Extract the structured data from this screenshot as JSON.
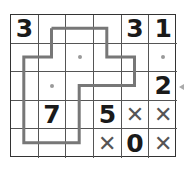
{
  "puzzle": {
    "rows": 5,
    "cols": 6,
    "cells": [
      [
        "3",
        "",
        "",
        "",
        "3",
        "1"
      ],
      [
        "",
        "",
        "",
        "",
        "",
        ""
      ],
      [
        "",
        "",
        "",
        "",
        "",
        "2"
      ],
      [
        "",
        "7",
        "",
        "5",
        "x",
        "x"
      ],
      [
        "",
        "",
        "",
        "x",
        "0",
        "x"
      ]
    ],
    "dots": [
      [
        1,
        2
      ],
      [
        2,
        1
      ],
      [
        1,
        5
      ]
    ],
    "loop_path": [
      [
        0,
        1
      ],
      [
        0,
        3
      ],
      [
        1,
        3
      ],
      [
        1,
        4
      ],
      [
        2,
        4
      ],
      [
        2,
        2
      ],
      [
        4,
        2
      ],
      [
        4,
        0
      ],
      [
        1,
        0
      ],
      [
        1,
        1
      ],
      [
        0,
        1
      ]
    ],
    "row_indicator": {
      "row": 2,
      "side": "right"
    }
  },
  "colors": {
    "grid_line": "#555555",
    "loop": "#777777",
    "number": "#1a1a1a",
    "cross": "#555555",
    "dot": "#9a9a9a"
  }
}
